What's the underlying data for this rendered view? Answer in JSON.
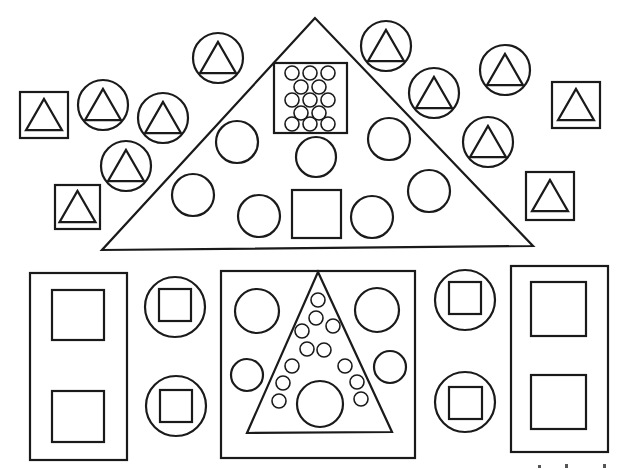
{
  "colors": {
    "stroke": "#1a1a1a",
    "background": "#ffffff"
  },
  "figures": {
    "top_big_triangle": {
      "label": "Large triangle",
      "contains": {
        "circles": 8,
        "squares": 1,
        "box_of_small_circles": 13
      }
    },
    "triangle_in_circle_count": 9,
    "triangle_in_square_count": 4,
    "bottom_row": {
      "left_rect_squares": 2,
      "left_circles_with_square": 2,
      "center_rect": {
        "circles": 4,
        "inner_triangle": {
          "small_circles": 15,
          "large_circles": 1
        }
      },
      "right_circles_with_square": 2,
      "right_rect_squares": 2
    }
  }
}
